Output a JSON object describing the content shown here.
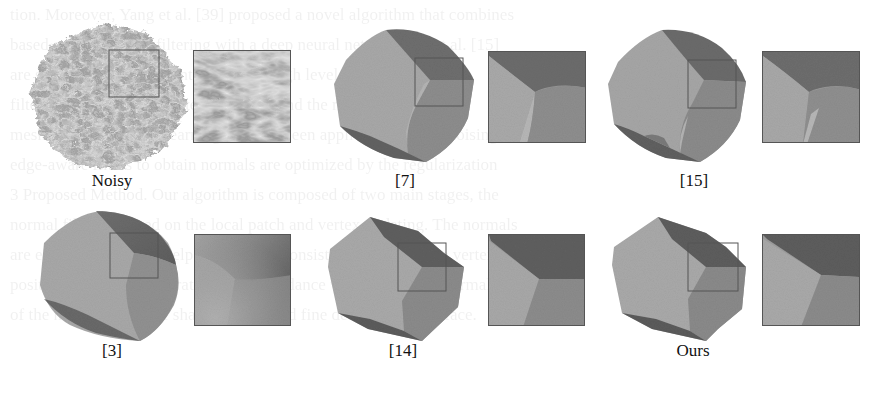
{
  "figure": {
    "panels": [
      {
        "id": "noisy",
        "label": "Noisy",
        "kind": "noisy"
      },
      {
        "id": "ref7",
        "label": "[7]",
        "kind": "smooth-rounded"
      },
      {
        "id": "ref15",
        "label": "[15]",
        "kind": "smooth-artifact"
      },
      {
        "id": "ref3",
        "label": "[3]",
        "kind": "oversmoothed"
      },
      {
        "id": "ref14",
        "label": "[14]",
        "kind": "sharp"
      },
      {
        "id": "ours",
        "label": "Ours",
        "kind": "sharpest"
      }
    ],
    "colors": {
      "light_face": "#a9a9a9",
      "mid_face": "#8c8c8c",
      "dark_face": "#5e5e5e",
      "inset_border": "#555555",
      "label_text": "#111111",
      "background": "#ffffff"
    }
  },
  "bleed_text": [
    "tion. Moreover, Yang et al. [39] proposed a novel algorithm that combines",
    "based guided normal filtering with a deep neural network. Ho et al. [15]",
    "are smoothed in a different way when high levels of noise. Many",
    "filtering with iterative vertex updating, and the resulting meshes are",
    "mesh denoising. Deep learning has also been applied to mesh denoising. [37]",
    "edge-aware filters to obtain normals are optimized by the regularization",
    "",
    "3 Proposed Method. Our algorithm is composed of two main stages, the",
    "normal filtering based on the local patch and vertex updating. The normals",
    "are estimated with the help of the patch consistency and then the vertex",
    "positions are updated iteratively in accordance with the filtered normals",
    "of the mesh to preserve sharp features and fine details of the surface."
  ]
}
